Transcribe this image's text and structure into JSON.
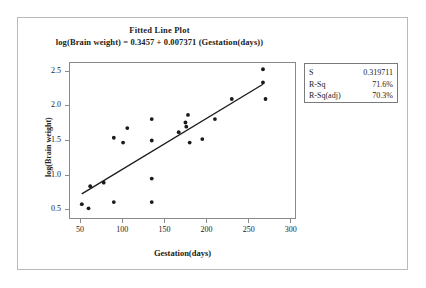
{
  "chart_data": {
    "type": "scatter",
    "title": "Fitted Line Plot",
    "subtitle": "log(Brain weight) = 0.3457 + 0.007371 (Gestation(days))",
    "xlabel": "Gestation(days)",
    "ylabel": "log(Brain weight)",
    "xlim": [
      38,
      305
    ],
    "ylim": [
      0.38,
      2.62
    ],
    "xticks": [
      50,
      100,
      150,
      200,
      250,
      300
    ],
    "xtick_labels": [
      "50",
      "100",
      "150",
      "200",
      "250",
      "300"
    ],
    "yticks": [
      0.5,
      1.0,
      1.5,
      2.0,
      2.5
    ],
    "ytick_labels": [
      "0.5",
      "1.0",
      "1.5",
      "2.0",
      "2.5"
    ],
    "grid": false,
    "legend": "none",
    "marker_color": "#1a1a1a",
    "line_color": "#1a1a1a",
    "points": [
      {
        "x": 52,
        "y": 0.58
      },
      {
        "x": 60,
        "y": 0.52
      },
      {
        "x": 62,
        "y": 0.84
      },
      {
        "x": 78,
        "y": 0.89
      },
      {
        "x": 90,
        "y": 1.54
      },
      {
        "x": 90,
        "y": 0.61
      },
      {
        "x": 101,
        "y": 1.47
      },
      {
        "x": 106,
        "y": 1.68
      },
      {
        "x": 135,
        "y": 1.81
      },
      {
        "x": 135,
        "y": 1.5
      },
      {
        "x": 135,
        "y": 0.95
      },
      {
        "x": 135,
        "y": 0.61
      },
      {
        "x": 167,
        "y": 1.62
      },
      {
        "x": 175,
        "y": 1.76
      },
      {
        "x": 176,
        "y": 1.7
      },
      {
        "x": 178,
        "y": 1.87
      },
      {
        "x": 180,
        "y": 1.47
      },
      {
        "x": 195,
        "y": 1.52
      },
      {
        "x": 210,
        "y": 1.81
      },
      {
        "x": 230,
        "y": 2.1
      },
      {
        "x": 267,
        "y": 2.53
      },
      {
        "x": 267,
        "y": 2.34
      },
      {
        "x": 270,
        "y": 2.1
      }
    ],
    "fit_line": {
      "intercept": 0.3457,
      "slope": 0.007371,
      "x_start": 52,
      "x_end": 267
    }
  },
  "stats": {
    "rows": [
      {
        "key": "S",
        "value": "0.319711"
      },
      {
        "key": "R-Sq",
        "value": "71.6%"
      },
      {
        "key": "R-Sq(adj)",
        "value": "70.3%"
      }
    ]
  }
}
